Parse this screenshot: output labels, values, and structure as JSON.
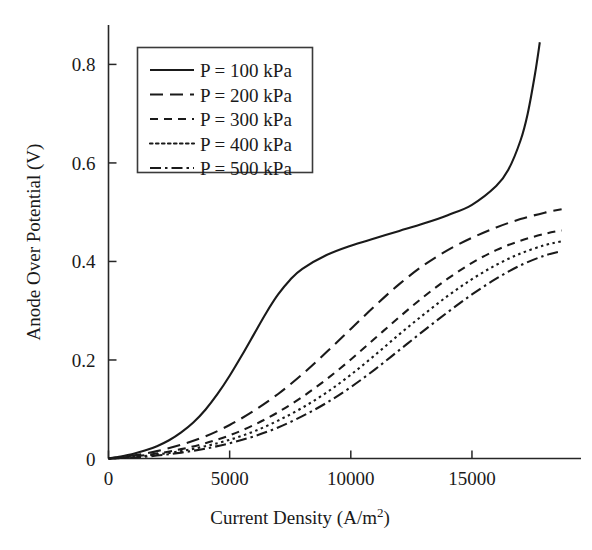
{
  "chart_data": {
    "type": "line",
    "title": "",
    "xlabel": "Current Density (A/m",
    "xlabel_sup": "2",
    "xlabel_tail": ")",
    "ylabel": "Anode Over Potential (V)",
    "xlim": [
      0,
      19500
    ],
    "ylim": [
      0,
      0.88
    ],
    "xticks": [
      0,
      5000,
      10000,
      15000
    ],
    "xticklabels": [
      "0",
      "5000",
      "10000",
      "15000"
    ],
    "yticks": [
      0,
      0.2,
      0.4,
      0.6,
      0.8
    ],
    "yticklabels": [
      "0",
      "0.2",
      "0.4",
      "0.6",
      "0.8"
    ],
    "grid": false,
    "legend_position": "upper-left",
    "line_color": "#1a1a1a",
    "series": [
      {
        "name": "P = 100 kPa",
        "style": "solid",
        "dasharray": "none",
        "x": [
          0,
          500,
          1000,
          1500,
          2000,
          2500,
          3000,
          3500,
          4000,
          4500,
          5000,
          5500,
          6000,
          6500,
          7000,
          7500,
          8000,
          9000,
          10000,
          11000,
          12000,
          13000,
          14000,
          15000,
          16000,
          16500,
          17000,
          17300,
          17600,
          17800
        ],
        "y": [
          0,
          0.004,
          0.009,
          0.016,
          0.025,
          0.037,
          0.053,
          0.073,
          0.099,
          0.131,
          0.168,
          0.209,
          0.252,
          0.295,
          0.333,
          0.363,
          0.385,
          0.413,
          0.432,
          0.447,
          0.462,
          0.477,
          0.494,
          0.515,
          0.553,
          0.586,
          0.645,
          0.7,
          0.78,
          0.845
        ]
      },
      {
        "name": "P = 200 kPa",
        "style": "dashed-long",
        "dasharray": "13,7",
        "x": [
          0,
          1000,
          2000,
          3000,
          4000,
          5000,
          6000,
          7000,
          8000,
          9000,
          10000,
          11000,
          12000,
          13000,
          14000,
          15000,
          16000,
          17000,
          18000,
          18700
        ],
        "y": [
          0,
          0.006,
          0.015,
          0.028,
          0.045,
          0.068,
          0.097,
          0.131,
          0.171,
          0.216,
          0.263,
          0.31,
          0.354,
          0.392,
          0.423,
          0.448,
          0.469,
          0.486,
          0.499,
          0.506
        ]
      },
      {
        "name": "P = 300 kPa",
        "style": "dashed-short",
        "dasharray": "8,6",
        "x": [
          0,
          1000,
          2000,
          3000,
          4000,
          5000,
          6000,
          7000,
          8000,
          9000,
          10000,
          11000,
          12000,
          13000,
          14000,
          15000,
          16000,
          17000,
          18000,
          18700
        ],
        "y": [
          0,
          0.004,
          0.01,
          0.019,
          0.031,
          0.047,
          0.068,
          0.094,
          0.125,
          0.161,
          0.201,
          0.244,
          0.287,
          0.328,
          0.365,
          0.397,
          0.423,
          0.442,
          0.456,
          0.463
        ]
      },
      {
        "name": "P = 400 kPa",
        "style": "dotted",
        "dasharray": "2.5,3.5",
        "x": [
          0,
          1000,
          2000,
          3000,
          4000,
          5000,
          6000,
          7000,
          8000,
          9000,
          10000,
          11000,
          12000,
          13000,
          14000,
          15000,
          16000,
          17000,
          18000,
          18700
        ],
        "y": [
          0,
          0.003,
          0.008,
          0.015,
          0.025,
          0.038,
          0.055,
          0.077,
          0.103,
          0.134,
          0.17,
          0.21,
          0.252,
          0.292,
          0.33,
          0.364,
          0.393,
          0.416,
          0.433,
          0.441
        ]
      },
      {
        "name": "P = 500 kPa",
        "style": "dash-dot",
        "dasharray": "11,4,2.5,4",
        "x": [
          0,
          1000,
          2000,
          3000,
          4000,
          5000,
          6000,
          7000,
          8000,
          9000,
          10000,
          11000,
          12000,
          13000,
          14000,
          15000,
          16000,
          17000,
          18000,
          18700
        ],
        "y": [
          0,
          0.002,
          0.006,
          0.012,
          0.02,
          0.031,
          0.045,
          0.063,
          0.086,
          0.113,
          0.145,
          0.181,
          0.22,
          0.259,
          0.297,
          0.333,
          0.365,
          0.392,
          0.412,
          0.421
        ]
      }
    ]
  },
  "legend": {
    "items": [
      {
        "label": "P = 100 kPa"
      },
      {
        "label": "P = 200 kPa"
      },
      {
        "label": "P = 300 kPa"
      },
      {
        "label": "P = 400 kPa"
      },
      {
        "label": "P = 500 kPa"
      }
    ]
  }
}
